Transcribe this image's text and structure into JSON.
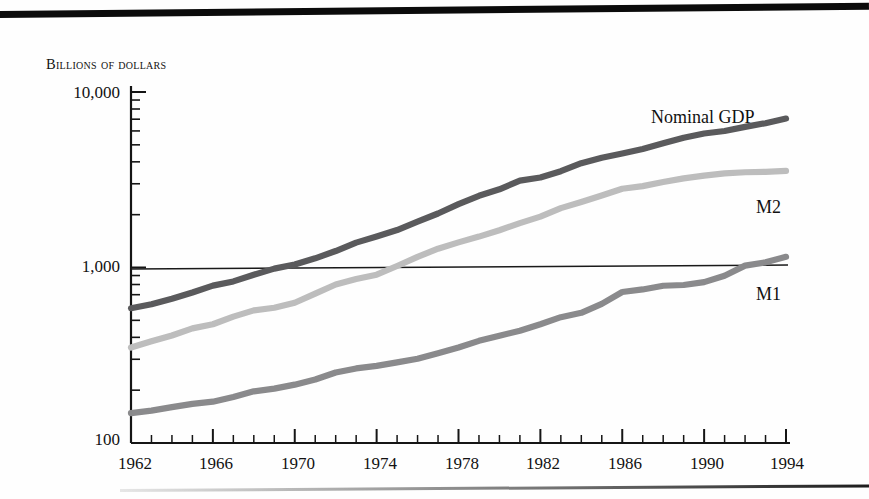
{
  "figure": {
    "y_axis_caption": "Billions of dollars",
    "y_tick_labels": [
      "10,000",
      "1,000",
      "100"
    ],
    "x_tick_labels": [
      "1962",
      "1966",
      "1970",
      "1974",
      "1978",
      "1982",
      "1986",
      "1990",
      "1994"
    ],
    "series_labels": {
      "gdp": "Nominal GDP",
      "m2": "M2",
      "m1": "M1"
    },
    "colors": {
      "gdp": "#5a5a5c",
      "m2": "#bdbdbd",
      "m1": "#8a8a8c",
      "axis": "#151515",
      "rule": "#0b0b0b",
      "gridline": "#1a1a1a"
    }
  },
  "chart_data": {
    "type": "line",
    "title": "",
    "subtitle": "",
    "xlabel": "",
    "ylabel": "Billions of dollars",
    "yscale": "log",
    "ylim": [
      100,
      10000
    ],
    "xlim": [
      1962,
      1994
    ],
    "grid": "single horizontal reference line at 1,000",
    "legend": "inline labels at right end of each series",
    "y_ticks_major": [
      100,
      1000,
      10000
    ],
    "y_ticks_minor": [
      200,
      300,
      400,
      500,
      600,
      700,
      800,
      900,
      2000,
      3000,
      4000,
      5000,
      6000,
      7000,
      8000,
      9000
    ],
    "x_ticks_major": [
      1962,
      1966,
      1970,
      1974,
      1978,
      1982,
      1986,
      1990,
      1994
    ],
    "x_ticks_minor_interval": 1,
    "x": [
      1962,
      1963,
      1964,
      1965,
      1966,
      1967,
      1968,
      1969,
      1970,
      1971,
      1972,
      1973,
      1974,
      1975,
      1976,
      1977,
      1978,
      1979,
      1980,
      1981,
      1982,
      1983,
      1984,
      1985,
      1986,
      1987,
      1988,
      1989,
      1990,
      1991,
      1992,
      1993,
      1994
    ],
    "series": [
      {
        "name": "Nominal GDP",
        "color": "#5a5a5c",
        "values": [
          586,
          618,
          664,
          720,
          788,
          833,
          910,
          985,
          1039,
          1128,
          1241,
          1386,
          1501,
          1635,
          1824,
          2031,
          2295,
          2563,
          2789,
          3128,
          3255,
          3537,
          3933,
          4220,
          4463,
          4740,
          5104,
          5484,
          5803,
          5996,
          6326,
          6642,
          7054
        ]
      },
      {
        "name": "M2",
        "color": "#bdbdbd",
        "values": [
          350,
          380,
          410,
          450,
          475,
          525,
          570,
          590,
          630,
          710,
          800,
          860,
          910,
          1020,
          1150,
          1280,
          1390,
          1500,
          1630,
          1790,
          1950,
          2180,
          2360,
          2570,
          2810,
          2910,
          3070,
          3220,
          3340,
          3440,
          3490,
          3510,
          3550
        ]
      },
      {
        "name": "M1",
        "color": "#8a8a8c",
        "values": [
          148,
          153,
          160,
          167,
          172,
          183,
          197,
          204,
          215,
          230,
          252,
          266,
          275,
          288,
          302,
          325,
          350,
          382,
          409,
          436,
          475,
          521,
          552,
          620,
          725,
          750,
          787,
          795,
          825,
          897,
          1025,
          1070,
          1150
        ]
      }
    ],
    "annotations": [
      {
        "text": "Nominal GDP",
        "x": 1989,
        "y": 7400
      },
      {
        "text": "M2",
        "x": 1993.5,
        "y": 2650
      },
      {
        "text": "M1",
        "x": 1993.5,
        "y": 640
      }
    ]
  }
}
